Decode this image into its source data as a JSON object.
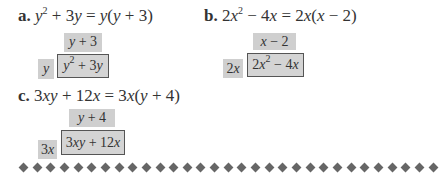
{
  "examples": [
    {
      "label": "a.",
      "equation_html": "y² + 3y = y(y + 3)",
      "factor": "y",
      "quotient": "y + 3",
      "product": "y² + 3y"
    },
    {
      "label": "b.",
      "equation_html": "2x² − 4x = 2x(x − 2)",
      "factor": "2x",
      "quotient": "x − 2",
      "product": "2x² − 4x"
    },
    {
      "label": "c.",
      "equation_html": "3xy + 12x = 3x(y + 4)",
      "factor": "3x",
      "quotient": "y + 4",
      "product": "3xy + 12x"
    }
  ],
  "divider": {
    "count": 31,
    "color": "#666666"
  }
}
